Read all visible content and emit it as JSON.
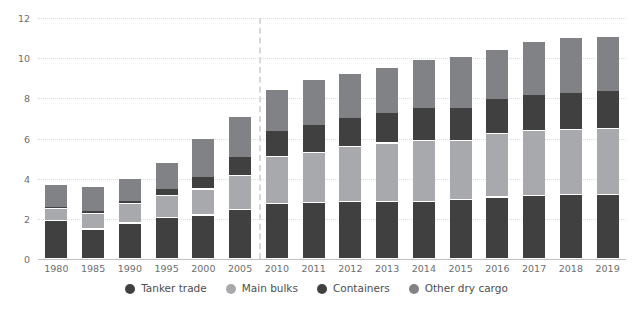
{
  "chart_data": {
    "type": "bar",
    "stacked": true,
    "title": "",
    "subtitle": "",
    "xlabel": "",
    "ylabel": "",
    "ylim": [
      0,
      12
    ],
    "yticks": [
      0,
      2,
      4,
      6,
      8,
      10,
      12
    ],
    "ytick_labels": [
      "0",
      "2",
      "4",
      "6",
      "8",
      "10",
      "12"
    ],
    "grid": true,
    "legend_position": "bottom",
    "categories": [
      "1980",
      "1985",
      "1990",
      "1995",
      "2000",
      "2005",
      "2010",
      "2011",
      "2012",
      "2013",
      "2014",
      "2015",
      "2016",
      "2017",
      "2018",
      "2019"
    ],
    "series": [
      {
        "name": "Tanker trade",
        "color": "#404041",
        "values": [
          1.87,
          1.46,
          1.76,
          2.05,
          2.16,
          2.42,
          2.75,
          2.79,
          2.84,
          2.83,
          2.83,
          2.93,
          3.06,
          3.15,
          3.19,
          3.17
        ]
      },
      {
        "name": "Main bulks",
        "color": "#a7a9ac",
        "values": [
          0.61,
          0.79,
          0.99,
          1.1,
          1.3,
          1.71,
          2.34,
          2.48,
          2.73,
          2.92,
          3.06,
          2.95,
          3.17,
          3.2,
          3.21,
          3.29
        ]
      },
      {
        "name": "Containers",
        "color": "#404041",
        "values": [
          0.1,
          0.13,
          0.16,
          0.36,
          0.6,
          0.97,
          1.28,
          1.39,
          1.46,
          1.53,
          1.63,
          1.66,
          1.72,
          1.83,
          1.86,
          1.92
        ]
      },
      {
        "name": "Other dry cargo",
        "color": "#808285",
        "values": [
          1.12,
          1.19,
          1.09,
          1.27,
          1.9,
          1.96,
          2.03,
          2.24,
          2.2,
          2.24,
          2.38,
          2.51,
          2.48,
          2.62,
          2.72,
          2.66
        ]
      }
    ],
    "totals": [
      3.7,
      3.57,
      4.0,
      4.78,
      5.96,
      7.06,
      8.4,
      8.9,
      9.23,
      9.52,
      9.9,
      10.05,
      10.43,
      10.8,
      10.98,
      11.04
    ],
    "annotations": [
      {
        "name": "forecast-divider",
        "type": "vertical-dashed-line",
        "between": [
          "2005",
          "2010"
        ]
      }
    ]
  },
  "legend": {
    "items": [
      {
        "label": "Tanker trade",
        "color": "#404041"
      },
      {
        "label": "Main bulks",
        "color": "#a7a9ac"
      },
      {
        "label": "Containers",
        "color": "#404041"
      },
      {
        "label": "Other dry cargo",
        "color": "#808285"
      }
    ]
  }
}
